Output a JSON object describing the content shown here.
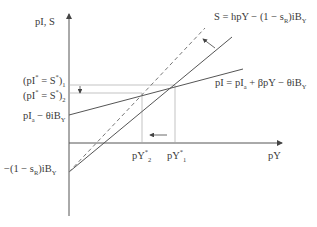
{
  "axes": {
    "y_label": "pI, S",
    "x_label": "pY"
  },
  "curves": {
    "saving_eq": "S = hpY − (1 − s_R)iB_Y",
    "investment_eq": "pI = pI_a + βpY − θiB_Y"
  },
  "y_ticks": {
    "eq1": "(pI* = S*)₁",
    "eq2": "(pI* = S*)₂",
    "intercept_I": "pI_a − θiB_Y",
    "intercept_S": "−(1 − s_R)iB_Y"
  },
  "x_ticks": {
    "y2": "pY*₂",
    "y1": "pY*₁"
  },
  "colors": {
    "line": "#555555",
    "guide": "#aaaaaa",
    "background": "#ffffff"
  }
}
